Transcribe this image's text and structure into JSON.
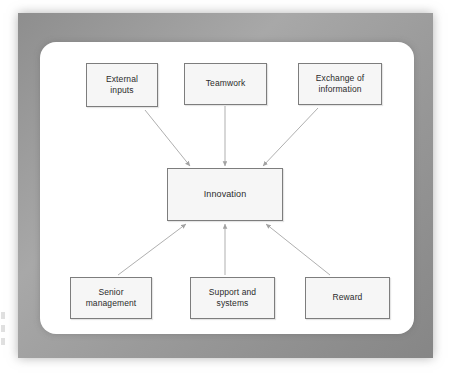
{
  "figure": {
    "center_node": {
      "id": "innovation",
      "label": "Innovation"
    },
    "top_nodes": [
      {
        "id": "external-inputs",
        "label": "External\ninputs"
      },
      {
        "id": "teamwork",
        "label": "Teamwork"
      },
      {
        "id": "exchange-of-information",
        "label": "Exchange of\ninformation"
      }
    ],
    "bottom_nodes": [
      {
        "id": "senior-management",
        "label": "Senior\nmanagement"
      },
      {
        "id": "support-and-systems",
        "label": "Support and\nsystems"
      },
      {
        "id": "reward",
        "label": "Reward"
      }
    ],
    "connections": [
      {
        "from": "External inputs",
        "to": "Innovation",
        "direction": "to-center"
      },
      {
        "from": "Teamwork",
        "to": "Innovation",
        "direction": "to-center"
      },
      {
        "from": "Exchange of information",
        "to": "Innovation",
        "direction": "to-center"
      },
      {
        "from": "Senior management",
        "to": "Innovation",
        "direction": "to-center"
      },
      {
        "from": "Support and systems",
        "to": "Innovation",
        "direction": "to-center"
      },
      {
        "from": "Reward",
        "to": "Innovation",
        "direction": "to-center"
      }
    ],
    "colors": {
      "node_fill": "#f6f6f6",
      "node_border": "#7d7d7d",
      "arrow": "#9e9e9e",
      "frame": "#9a9a9a",
      "panel": "#ffffff",
      "text": "#2b2b2b"
    }
  }
}
